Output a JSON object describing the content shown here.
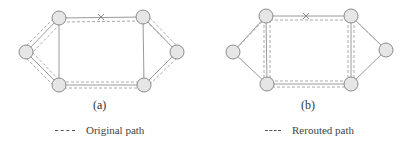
{
  "panels": [
    {
      "id": "a",
      "caption": "(a)",
      "nodes": [
        {
          "name": "left",
          "x": 26,
          "y": 52
        },
        {
          "name": "top-left",
          "x": 59,
          "y": 18
        },
        {
          "name": "bottom-left",
          "x": 59,
          "y": 85
        },
        {
          "name": "top-right",
          "x": 143,
          "y": 17
        },
        {
          "name": "right",
          "x": 177,
          "y": 52
        },
        {
          "name": "bottom-right",
          "x": 144,
          "y": 85
        }
      ],
      "failed_link_mark": {
        "x": 101,
        "y": 17
      },
      "path_type": "original"
    },
    {
      "id": "b",
      "caption": "(b)",
      "nodes": [
        {
          "name": "left",
          "x": 233,
          "y": 52
        },
        {
          "name": "top-left",
          "x": 266,
          "y": 16
        },
        {
          "name": "bottom-left",
          "x": 267,
          "y": 84
        },
        {
          "name": "top-right",
          "x": 351,
          "y": 16
        },
        {
          "name": "right",
          "x": 386,
          "y": 50
        },
        {
          "name": "bottom-right",
          "x": 351,
          "y": 84
        }
      ],
      "failed_link_mark": {
        "x": 306,
        "y": 16
      },
      "path_type": "rerouted"
    }
  ],
  "legend": [
    {
      "label": "Original path",
      "style": "dashed"
    },
    {
      "label": "Rerouted path",
      "style": "dashed"
    }
  ],
  "colors": {
    "node_fill": "#e6e6e6",
    "node_stroke": "#8a8a8a",
    "link": "#9a9a9a",
    "path": "#aaaaaa"
  }
}
